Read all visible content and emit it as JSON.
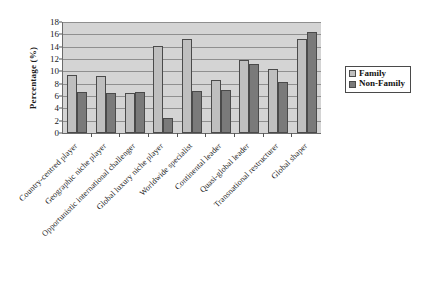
{
  "chart_data": {
    "type": "bar",
    "title": "",
    "xlabel": "",
    "ylabel": "Percentage (%)",
    "ylim": [
      0,
      18
    ],
    "ytick_step": 2,
    "yticks": [
      0,
      2,
      4,
      6,
      8,
      10,
      12,
      14,
      16,
      18
    ],
    "grid": true,
    "grid_axis": "y",
    "legend_position": "right",
    "categories": [
      "Country-centred player",
      "Geographic niche player",
      "Opportunistic international challenger",
      "Global luxury niche player",
      "Worldwide specialist",
      "Continental leader",
      "Quasi-global leader",
      "Transnational restructurer",
      "Global shaper"
    ],
    "series": [
      {
        "name": "Family",
        "color": "#bfbfbf",
        "values": [
          9.4,
          9.2,
          6.5,
          14.1,
          15.3,
          8.6,
          11.9,
          10.3,
          15.3
        ]
      },
      {
        "name": "Non-Family",
        "color": "#7a7a7a",
        "values": [
          6.6,
          6.5,
          6.6,
          2.5,
          6.8,
          6.9,
          11.2,
          8.2,
          16.3
        ]
      }
    ]
  },
  "axes": {
    "y_title": "Percentage (%)"
  },
  "legend": {
    "entries": [
      {
        "label": "Family"
      },
      {
        "label": "Non-Family"
      }
    ]
  },
  "colors": {
    "family": "#bfbfbf",
    "non_family": "#7a7a7a",
    "plot_background": "#d4d4d4",
    "gridline": "#8f8f8f",
    "axis": "#6b6b6b",
    "page_background": "#ffffff"
  }
}
